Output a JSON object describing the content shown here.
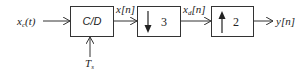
{
  "diagram": {
    "input": {
      "label": "x",
      "subscript": "c",
      "suffix": "(t)"
    },
    "sampler": {
      "label": "C/D",
      "control": {
        "label": "T",
        "subscript": "s"
      }
    },
    "signal_after_sampler": {
      "label": "x[n]"
    },
    "downsampler": {
      "factor": "3",
      "direction": "down"
    },
    "signal_after_downsampler": {
      "label": "x",
      "subscript": "d",
      "suffix": "[n]"
    },
    "upsampler": {
      "factor": "2",
      "direction": "up"
    },
    "output": {
      "label": "y[n]"
    },
    "colors": {
      "stroke": "#333333",
      "text": "#222222",
      "background": "#ffffff"
    }
  }
}
